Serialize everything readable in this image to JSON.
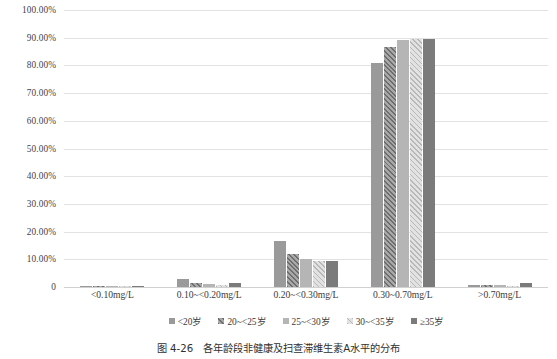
{
  "chart_data": {
    "type": "bar",
    "title": "",
    "xlabel": "",
    "ylabel": "",
    "ylim": [
      0,
      100
    ],
    "grid": true,
    "legend_position": "bottom",
    "categories": [
      "<0.10mg/L",
      "0.10~<0.20mg/L",
      "0.20~<0.30mg/L",
      "0.30~0.70mg/L",
      ">0.70mg/L"
    ],
    "ytick_labels": [
      "100.00%",
      "90.00%",
      "80.00%",
      "70.00%",
      "60.00%",
      "50.00%",
      "40.00%",
      "30.00%",
      "20.00%",
      "10.00%",
      "0"
    ],
    "ytick_values": [
      100,
      90,
      80,
      70,
      60,
      50,
      40,
      30,
      20,
      10,
      0
    ],
    "series": [
      {
        "name": "<20岁",
        "values": [
          0.4,
          2.8,
          16.5,
          80.8,
          0.8
        ]
      },
      {
        "name": "20~<25岁",
        "values": [
          0.3,
          1.5,
          12.0,
          86.8,
          0.9
        ]
      },
      {
        "name": "25~<30岁",
        "values": [
          0.2,
          1.0,
          10.0,
          89.0,
          0.8
        ]
      },
      {
        "name": "30~<35岁",
        "values": [
          0.2,
          0.6,
          9.4,
          89.6,
          0.5
        ]
      },
      {
        "name": "≥35岁",
        "values": [
          0.3,
          1.4,
          9.5,
          89.4,
          1.5
        ]
      }
    ]
  },
  "caption": {
    "text": "图 4-26　各年龄段非健康及扫查滞维生素A水平的分布"
  }
}
